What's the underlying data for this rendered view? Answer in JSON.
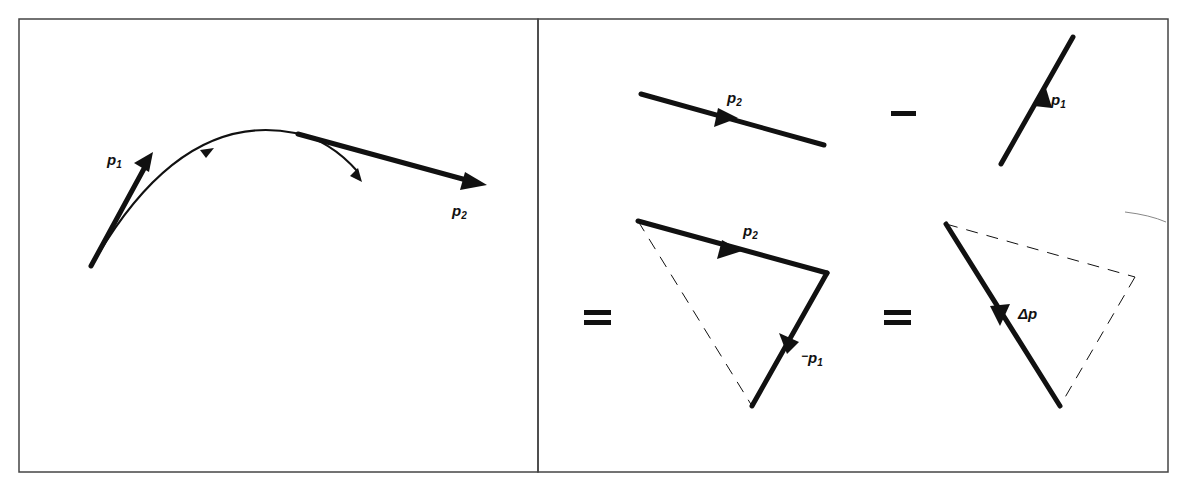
{
  "figure": {
    "left_panel": {
      "title": "trajectory",
      "labels": {
        "p1": "p",
        "p1_sub": "1",
        "p2": "p",
        "p2_sub": "2"
      }
    },
    "right_panel": {
      "title": "vector subtraction",
      "top_row": {
        "p2": "p",
        "p2_sub": "2",
        "operator_minus": "−",
        "p1": "p",
        "p1_sub": "1"
      },
      "bottom_row": {
        "equals_1": "=",
        "triangle_p2": "p",
        "triangle_p2_sub": "2",
        "neg_p1_prefix": "−",
        "neg_p1": "p",
        "neg_p1_sub": "1",
        "equals_2": "=",
        "delta_p": "Δp"
      }
    },
    "colors": {
      "ink": "#111111",
      "frame": "#444444",
      "background": "#ffffff"
    }
  }
}
